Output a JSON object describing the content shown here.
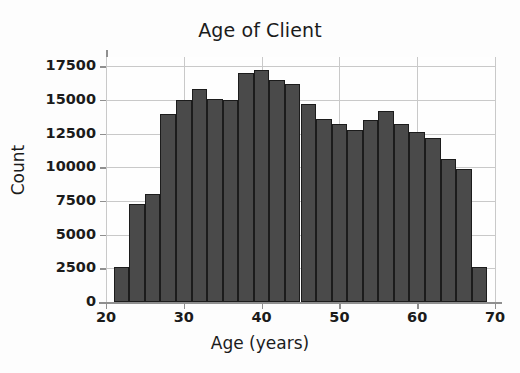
{
  "chart_data": {
    "type": "bar",
    "title": "Age of Client",
    "xlabel": "Age (years)",
    "ylabel": "Count",
    "xlim": [
      20,
      70
    ],
    "ylim": [
      0,
      18200
    ],
    "grid": true,
    "legend": null,
    "bin_width": 2,
    "xticks": [
      20,
      30,
      40,
      50,
      60,
      70
    ],
    "xtick_labels": [
      "20",
      "30",
      "40",
      "50",
      "60",
      "70"
    ],
    "yticks": [
      0,
      2500,
      5000,
      7500,
      10000,
      12500,
      15000,
      17500
    ],
    "ytick_labels": [
      "0",
      "2500",
      "5000",
      "7500",
      "10000",
      "12500",
      "15000",
      "17500"
    ],
    "bar_color": "#4a4a4a",
    "bar_edge_color": "#1c1c1c",
    "categories": [
      "21-23",
      "23-25",
      "25-27",
      "27-29",
      "29-31",
      "31-33",
      "33-35",
      "35-37",
      "37-39",
      "39-41",
      "41-43",
      "43-45",
      "45-47",
      "47-49",
      "49-51",
      "51-53",
      "53-55",
      "55-57",
      "57-59",
      "59-61",
      "61-63",
      "63-65",
      "65-67",
      "67-69"
    ],
    "bin_edges": [
      21,
      23,
      25,
      27,
      29,
      31,
      33,
      35,
      37,
      39,
      41,
      43,
      45,
      47,
      49,
      51,
      53,
      55,
      57,
      59,
      61,
      63,
      65,
      67,
      69
    ],
    "values": [
      2600,
      7300,
      8050,
      14000,
      15000,
      15800,
      15100,
      15000,
      17000,
      17200,
      16500,
      16200,
      14700,
      13600,
      13200,
      12800,
      13500,
      14200,
      13200,
      12600,
      12200,
      10600,
      9850,
      2600
    ]
  }
}
